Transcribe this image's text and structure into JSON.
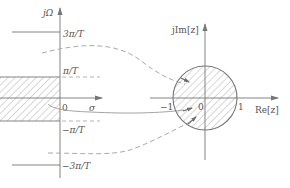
{
  "figure": {
    "colors": {
      "axis": "#777777",
      "curve": "#999999",
      "dashed": "#aaaaaa",
      "hatch": "#999999",
      "circle": "#777777",
      "text": "#555555"
    }
  },
  "s_plane": {
    "vertical_axis_label": "jΩ",
    "horizontal_axis_label": "σ",
    "origin_label": "0",
    "ticks": [
      {
        "id": "plus_3pi",
        "label": "3π/T"
      },
      {
        "id": "plus_pi",
        "label": "π/T"
      },
      {
        "id": "minus_pi",
        "label": "−π/T"
      },
      {
        "id": "minus_3pi",
        "label": "−3π/T"
      }
    ],
    "shaded_region": "left half of strip −π/T < Ω < π/T"
  },
  "z_plane": {
    "vertical_axis_label": "jIm[z]",
    "horizontal_axis_label": "Re[z]",
    "origin_label": "0",
    "tick_minus_one": "−1",
    "tick_one": "1",
    "shaded_region": "interior of unit circle"
  },
  "mappings": [
    {
      "id": "upper-dashed",
      "style": "dashed",
      "from": "line at π/T",
      "to": "upper arc of unit circle"
    },
    {
      "id": "center-solid",
      "style": "solid",
      "from": "σ axis near origin",
      "to": "interior near −1"
    },
    {
      "id": "lower-dashed",
      "style": "dashed",
      "from": "line at −π/T",
      "to": "lower arc of unit circle"
    }
  ]
}
